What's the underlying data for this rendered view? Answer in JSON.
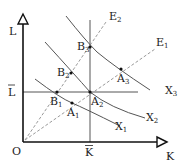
{
  "diagram": {
    "axes": {
      "y_label": "L",
      "x_label": "K",
      "origin_label": "O",
      "l_bar_label": "L",
      "k_bar_label": "K"
    },
    "rays": [
      {
        "name": "E",
        "sub": "1"
      },
      {
        "name": "E",
        "sub": "2"
      }
    ],
    "isoquants": [
      {
        "name": "X",
        "sub": "1"
      },
      {
        "name": "X",
        "sub": "2"
      },
      {
        "name": "X",
        "sub": "3"
      }
    ],
    "points": [
      {
        "name": "A",
        "sub": "1"
      },
      {
        "name": "A",
        "sub": "2"
      },
      {
        "name": "A",
        "sub": "3"
      },
      {
        "name": "B",
        "sub": "1"
      },
      {
        "name": "B",
        "sub": "2"
      },
      {
        "name": "B",
        "sub": "3"
      }
    ],
    "colors": {
      "axis": "#111111",
      "curve": "#555555",
      "ray": "#9a9a9a",
      "guide": "#555555"
    }
  }
}
